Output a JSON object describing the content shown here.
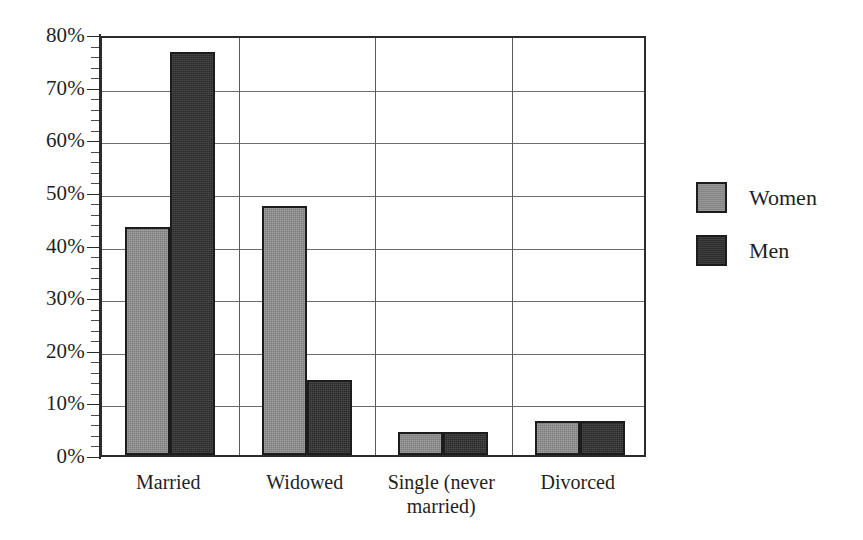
{
  "chart_data": {
    "type": "bar",
    "title": "",
    "subtitle": "",
    "xlabel": "",
    "ylabel": "",
    "ylim": [
      0,
      80
    ],
    "y_tick_labels": [
      "80%",
      "70%",
      "60%",
      "50%",
      "40%",
      "30%",
      "20%",
      "10%",
      "0%"
    ],
    "y_tick_values": [
      80,
      70,
      60,
      50,
      40,
      30,
      20,
      10,
      0
    ],
    "y_minor_tick_step": 2,
    "grid": true,
    "grid_axis": "y",
    "legend_position": "right",
    "categories": [
      "Married",
      "Widowed",
      "Single (never married)",
      "Divorced"
    ],
    "category_label_lines": [
      [
        "Married"
      ],
      [
        "Widowed"
      ],
      [
        "Single (never",
        "married)"
      ],
      [
        "Divorced"
      ]
    ],
    "series": [
      {
        "name": "Women",
        "color": "#8c8c8c",
        "values": [
          43.3,
          47.4,
          4.3,
          6.4
        ]
      },
      {
        "name": "Men",
        "color": "#323232",
        "values": [
          76.5,
          14.3,
          4.3,
          6.4
        ]
      }
    ],
    "value_unit": "%"
  },
  "legend": {
    "items": [
      {
        "label": "Women",
        "swatch": "women-swatch"
      },
      {
        "label": "Men",
        "swatch": "men-swatch"
      }
    ]
  },
  "colors": {
    "women": "#8c8c8c",
    "men": "#323232",
    "axis": "#2b2b2b",
    "gridline": "#6d6d6d",
    "background": "#ffffff",
    "text": "#1f1f1f"
  }
}
